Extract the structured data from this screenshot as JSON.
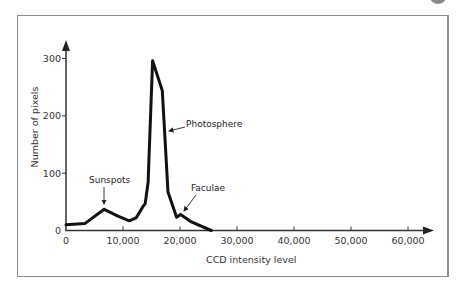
{
  "chart_data": {
    "type": "line",
    "title": "",
    "xlabel": "CCD intensity level",
    "ylabel": "Number of pixels",
    "xlim": [
      0,
      62000
    ],
    "ylim": [
      0,
      320
    ],
    "x_ticks": [
      0,
      10000,
      20000,
      30000,
      40000,
      50000,
      60000
    ],
    "x_tick_labels": [
      "0",
      "10,000",
      "20,000",
      "30,000",
      "40,000",
      "50,000",
      "60,000"
    ],
    "y_ticks": [
      0,
      100,
      200,
      300
    ],
    "y_tick_labels": [
      "0",
      "100",
      "200",
      "300"
    ],
    "grid": false,
    "legend": null,
    "series": [
      {
        "name": "Histogram",
        "x": [
          0,
          3300,
          6700,
          9100,
          11100,
          12300,
          13600,
          13900,
          14400,
          15200,
          16900,
          17900,
          19400,
          20100,
          22000,
          25500
        ],
        "y": [
          10,
          12,
          37,
          25,
          17,
          22,
          43,
          47,
          84,
          296,
          244,
          67,
          23,
          28,
          15,
          0
        ]
      }
    ],
    "annotations": [
      {
        "text": "Sunspots",
        "x": 6700,
        "y": 37
      },
      {
        "text": "Photosphere",
        "x": 17600,
        "y": 175
      },
      {
        "text": "Faculae",
        "x": 20100,
        "y": 28
      }
    ]
  }
}
